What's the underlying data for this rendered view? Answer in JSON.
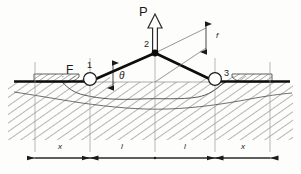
{
  "figure": {
    "type": "engineering-statics-diagram",
    "ground_line_label": "ground-surface"
  },
  "labels": {
    "force_P": "P",
    "force_F": "F",
    "node_1": "1",
    "node_2": "2",
    "node_3": "3",
    "angle_theta": "θ",
    "sag_f": "f"
  },
  "dimensions": {
    "left_x": "x",
    "left_l": "l",
    "right_l": "l",
    "right_x": "x"
  },
  "colors": {
    "ink": "#1a1a1a",
    "cable": "#0d0d0d",
    "thin_line": "#6a6a6a",
    "hatch": "#555555",
    "background": "#fdfdfb"
  },
  "geometry": {
    "ground_y": 82,
    "apex_x": 155,
    "apex_y": 53,
    "node1_x": 90,
    "node3_x": 215,
    "left_end_x": 35,
    "right_end_x": 270,
    "dimension_line_y": 158
  }
}
